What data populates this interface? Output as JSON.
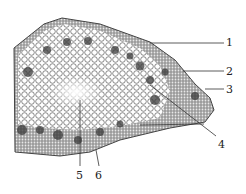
{
  "figure": {
    "background": "#ffffff",
    "ink": "#2a2a2a",
    "labels": [
      {
        "id": "1",
        "text": "1",
        "x": 226,
        "y": 37
      },
      {
        "id": "2",
        "text": "2",
        "x": 226,
        "y": 66
      },
      {
        "id": "3",
        "text": "3",
        "x": 226,
        "y": 84
      },
      {
        "id": "4",
        "text": "4",
        "x": 218,
        "y": 139
      },
      {
        "id": "5",
        "text": "5",
        "x": 76,
        "y": 170
      },
      {
        "id": "6",
        "text": "6",
        "x": 95,
        "y": 170
      }
    ]
  }
}
